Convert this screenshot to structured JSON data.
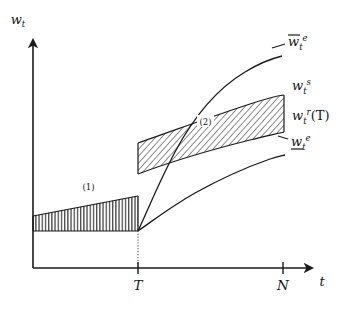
{
  "figure": {
    "title": "",
    "background_color": "#ffffff",
    "ink_color": "#141414"
  },
  "axes": {
    "y_label": "w",
    "y_label_sub": "t",
    "x_label": "t",
    "x_ticks": [
      {
        "name": "T",
        "label": "T",
        "x_px": 138
      },
      {
        "name": "N",
        "label": "N",
        "x_px": 283
      }
    ],
    "origin_px": {
      "x": 33,
      "y": 268
    },
    "y_axis_top_px": 36,
    "x_axis_right_px": 318
  },
  "curves": [
    {
      "id": "w-bar-e",
      "label_base": "w",
      "label_sub": "t",
      "label_sup": "e",
      "decoration": "overbar",
      "description": "upper expected wage path, steep concave rise after T",
      "label_x_px": 288,
      "label_y_px": 44
    },
    {
      "id": "w-s",
      "label_base": "w",
      "label_sub": "t",
      "label_sup": "s",
      "decoration": "none",
      "description": "upper edge of band, separation wage",
      "label_x_px": 292,
      "label_y_px": 88
    },
    {
      "id": "w-r-T",
      "label_base": "w",
      "label_sub": "t",
      "label_sup": "r",
      "label_arg": "(T)",
      "decoration": "none",
      "description": "lower edge of band, reservation wage at T",
      "label_x_px": 292,
      "label_y_px": 117
    },
    {
      "id": "w-underbar-e",
      "label_base": "w",
      "label_sub": "t",
      "label_sup": "e",
      "decoration": "underbar",
      "description": "lower expected wage path, concave rise after T",
      "label_x_px": 290,
      "label_y_px": 144
    }
  ],
  "regions": [
    {
      "id": "region-1",
      "label": "(1)",
      "hatch": "vertical",
      "label_x_px": 88,
      "label_y_px": 187,
      "description": "vertically hatched wedge between y-axis and T"
    },
    {
      "id": "region-2",
      "label": "(2)",
      "hatch": "diagonal",
      "label_x_px": 205,
      "label_y_px": 122,
      "description": "diagonally hatched band between w_t^s and w_t^r(T) after T"
    }
  ],
  "guides": [
    {
      "id": "t-dotted-line",
      "style": "dotted",
      "x_px": 138,
      "y_top_px": 196,
      "y_bottom_px": 268
    }
  ]
}
